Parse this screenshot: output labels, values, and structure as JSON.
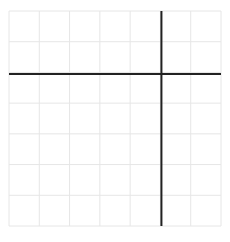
{
  "diagram": {
    "type": "coordinate-plane",
    "grid": {
      "columns": 7,
      "rows": 7,
      "color": "#e6e6e6"
    },
    "axes": {
      "color": "#222222",
      "y_axis_at_column_line": 5,
      "x_axis_at_row_line": 2
    },
    "labels": []
  }
}
